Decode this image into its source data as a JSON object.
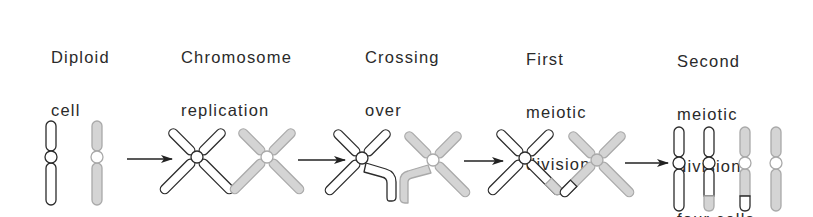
{
  "stages": [
    {
      "id": "diploid",
      "lines": [
        "Diploid",
        "cell"
      ]
    },
    {
      "id": "replication",
      "lines": [
        "Chromosome",
        "replication"
      ]
    },
    {
      "id": "crossing",
      "lines": [
        "Crossing",
        "over"
      ]
    },
    {
      "id": "first-division",
      "lines": [
        "First",
        "meiotic",
        "division"
      ]
    },
    {
      "id": "second-division",
      "lines": [
        "Second",
        "meiotic",
        "division,",
        "four cells"
      ]
    }
  ],
  "colors": {
    "outline": "#2b2b2b",
    "white_fill": "#ffffff",
    "gray_fill": "#d4d4d4",
    "gray_outline": "#a9a9a9",
    "arrow": "#222222"
  }
}
